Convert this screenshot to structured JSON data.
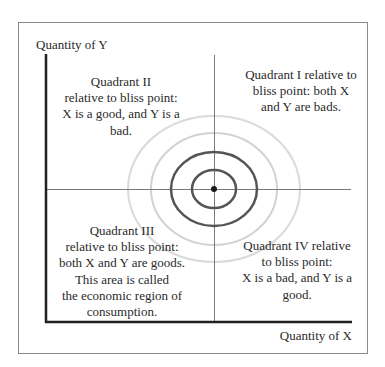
{
  "diagram": {
    "axes": {
      "y_label": "Quantity of Y",
      "x_label": "Quantity of X"
    },
    "bliss_point": {
      "label": "bliss point",
      "rings": 4
    },
    "quadrants": {
      "q1": {
        "lines": [
          "Quadrant I relative to",
          "bliss point: both X",
          "and Y are bads."
        ]
      },
      "q2": {
        "lines": [
          "Quadrant II",
          "relative to bliss point:",
          "X is a good, and Y is a",
          "bad."
        ]
      },
      "q3": {
        "lines": [
          "Quadrant III",
          "relative to bliss point:",
          "both X and Y are goods.",
          "This area is called",
          "the economic region of",
          "consumption."
        ]
      },
      "q4": {
        "lines": [
          "Quadrant IV relative",
          "to bliss point:",
          "X is a bad, and Y is a",
          "good."
        ]
      }
    },
    "colors": {
      "frame": "#8a8a8a",
      "axis": "#222222",
      "crosshair": "#777777",
      "dark_ring": "#555555",
      "light_ring": "#d6d6d6",
      "text": "#2a2a2a"
    }
  }
}
